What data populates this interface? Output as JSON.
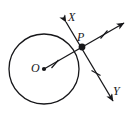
{
  "figure": {
    "type": "geometry-diagram",
    "background_color": "#ffffff",
    "stroke_color": "#17171a",
    "width": 133,
    "height": 116,
    "labels": {
      "center": "O",
      "point_on_circle": "P",
      "ray_upper_left": "X",
      "ray_lower_right": "Y"
    },
    "circle": {
      "name": "circle-O",
      "center_x": 44,
      "center_y": 69,
      "radius": 35,
      "fill": "none",
      "stroke_width": 1.3
    },
    "points": [
      {
        "name": "center-point-O",
        "label": "O",
        "x": 44,
        "y": 69,
        "marker": "filled-dot",
        "radius": 2.1
      },
      {
        "name": "tangent-point-P",
        "label": "P",
        "x": 82,
        "y": 47,
        "marker": "filled-dot",
        "radius": 3.4
      }
    ],
    "lines": [
      {
        "name": "radius-OP-extended",
        "from_x": 44,
        "from_y": 69,
        "to_x": 127,
        "to_y": 21,
        "arrow_end": true,
        "arrow_start": false,
        "stroke_width": 1.3
      },
      {
        "name": "line-XY-through-P",
        "from_x": 64,
        "from_y": 20,
        "to_x": 115,
        "to_y": 105,
        "arrow_end": true,
        "arrow_start": true,
        "stroke_width": 1.3
      }
    ],
    "tick_marks": [
      {
        "name": "tick-on-radius-OP",
        "x": 55,
        "y": 63,
        "angle_deg": -30,
        "length": 9
      },
      {
        "name": "tick-on-ray-beyond-P",
        "x": 104,
        "y": 34,
        "angle_deg": -30,
        "length": 9
      },
      {
        "name": "tick-on-line-XY-lower",
        "x": 96,
        "y": 73,
        "angle_deg": 59,
        "length": 9
      }
    ]
  }
}
